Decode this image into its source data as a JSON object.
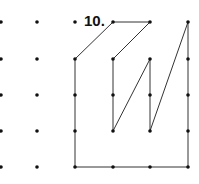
{
  "figure": {
    "label": "10.",
    "label_pos": [
      84,
      26
    ],
    "dot_color": "#111111",
    "line_color": "#333333",
    "grid_x": [
      1,
      37,
      75,
      113,
      150,
      188
    ],
    "grid_y": [
      22,
      59,
      95,
      131,
      167
    ],
    "dots": [
      [
        0,
        0
      ],
      [
        1,
        0
      ],
      [
        2,
        0
      ],
      [
        3,
        0
      ],
      [
        4,
        0
      ],
      [
        5,
        0
      ],
      [
        0,
        1
      ],
      [
        1,
        1
      ],
      [
        2,
        1
      ],
      [
        3,
        1
      ],
      [
        4,
        1
      ],
      [
        5,
        1
      ],
      [
        0,
        2
      ],
      [
        1,
        2
      ],
      [
        2,
        2
      ],
      [
        3,
        2
      ],
      [
        4,
        2
      ],
      [
        5,
        2
      ],
      [
        0,
        3
      ],
      [
        1,
        3
      ],
      [
        2,
        3
      ],
      [
        3,
        3
      ],
      [
        4,
        3
      ],
      [
        5,
        3
      ],
      [
        0,
        4
      ],
      [
        1,
        4
      ],
      [
        2,
        4
      ],
      [
        3,
        4
      ],
      [
        4,
        4
      ],
      [
        5,
        4
      ]
    ],
    "polyline": [
      [
        2,
        1
      ],
      [
        3,
        0
      ],
      [
        4,
        0
      ],
      [
        3,
        1
      ],
      [
        3,
        3
      ],
      [
        4,
        1
      ],
      [
        4,
        3
      ],
      [
        5,
        0
      ],
      [
        5,
        4
      ],
      [
        2,
        4
      ],
      [
        2,
        1
      ]
    ]
  }
}
